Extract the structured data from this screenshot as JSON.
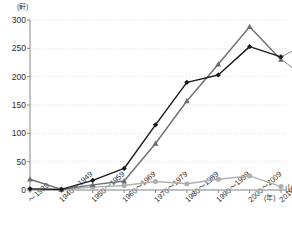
{
  "chart_data": {
    "type": "line",
    "title": "",
    "xlabel": "(年)",
    "ylabel": "(軒)",
    "ylim": [
      0,
      300
    ],
    "yticks": [
      0,
      50,
      100,
      150,
      200,
      250,
      300
    ],
    "grid": true,
    "legend_position": "right-inline",
    "categories": [
      "～1939",
      "1940～1949",
      "1950～1959",
      "1960～1969",
      "1970～1979",
      "1980～1989",
      "1990～1999",
      "2000～2009",
      "2010～2018"
    ],
    "series": [
      {
        "name": "下町",
        "color": "#1a1a1a",
        "marker": "diamond",
        "values": [
          2,
          1,
          17,
          38,
          115,
          190,
          203,
          253,
          235
        ]
      },
      {
        "name": "職人",
        "color": "#6e6e6e",
        "marker": "triangle",
        "values": [
          19,
          1,
          9,
          16,
          82,
          157,
          222,
          288,
          230
        ]
      },
      {
        "name": "山の手",
        "color": "#b0b0b0",
        "marker": "circle",
        "values": [
          1,
          1,
          5,
          8,
          15,
          11,
          19,
          25,
          6
        ]
      }
    ]
  },
  "axis": {
    "y_unit": "(軒)",
    "x_unit": "(年)",
    "axis_color": "#888888",
    "grid_color": "#c9c9c9"
  }
}
